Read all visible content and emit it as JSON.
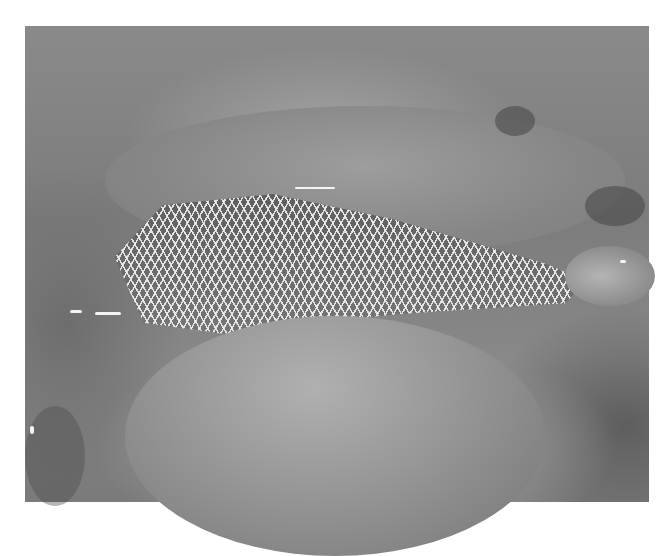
{
  "image": {
    "description": "Grayscale laparoscopic surgical view showing a woven mesh placed between tissue folds",
    "subject": "surgical mesh",
    "colors": {
      "background": "#ffffff",
      "tissue_mid": "#8a8a8a",
      "tissue_light": "#b0b0b0",
      "tissue_dark": "#4a4a4a",
      "mesh_strands": "#f0f0f0"
    }
  }
}
